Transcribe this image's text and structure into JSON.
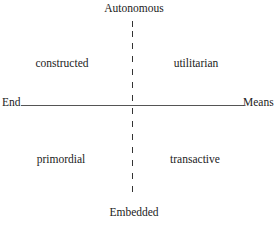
{
  "diagram": {
    "axes": {
      "vertical": {
        "top_label": "Autonomous",
        "bottom_label": "Embedded",
        "style": "dashed"
      },
      "horizontal": {
        "left_label": "End",
        "right_label": "Means",
        "style": "solid"
      }
    },
    "quadrants": {
      "top_left": "constructed",
      "top_right": "utilitarian",
      "bottom_left": "primordial",
      "bottom_right": "transactive"
    },
    "colors": {
      "text": "#222222",
      "lines": "#444444",
      "background": "#ffffff"
    }
  }
}
